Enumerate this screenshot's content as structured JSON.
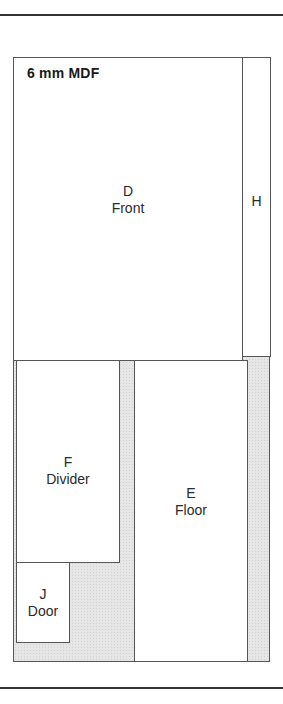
{
  "diagram": {
    "material_label": "6 mm MDF",
    "waste_color": "#e6e6e6",
    "pieces": {
      "D": {
        "code": "D",
        "name": "Front"
      },
      "H": {
        "code": "H",
        "name": ""
      },
      "F": {
        "code": "F",
        "name": "Divider"
      },
      "E": {
        "code": "E",
        "name": "Floor"
      },
      "J": {
        "code": "J",
        "name": "Door"
      }
    }
  }
}
